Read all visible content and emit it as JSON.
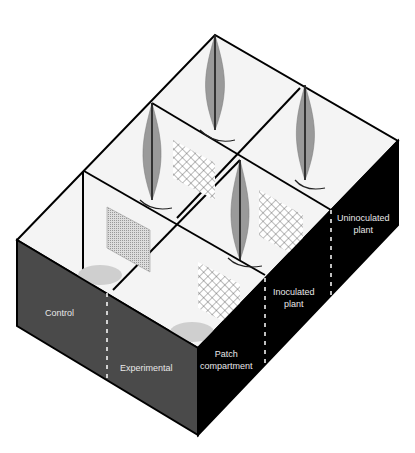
{
  "diagram": {
    "type": "isometric-box-diagram",
    "labels": {
      "control": "Control",
      "experimental": "Experimental",
      "patch_line1": "Patch",
      "patch_line2": "compartment",
      "inoculated_line1": "Inoculated",
      "inoculated_line2": "plant",
      "uninoculated_line1": "Uninoculated",
      "uninoculated_line2": "plant"
    },
    "colors": {
      "front_face": "#4a4a4a",
      "right_face": "#000000",
      "interior": "#f4f4f4",
      "edge": "#000000",
      "label_text": "#e8e8e8",
      "plant": "#9a9a9a"
    }
  }
}
